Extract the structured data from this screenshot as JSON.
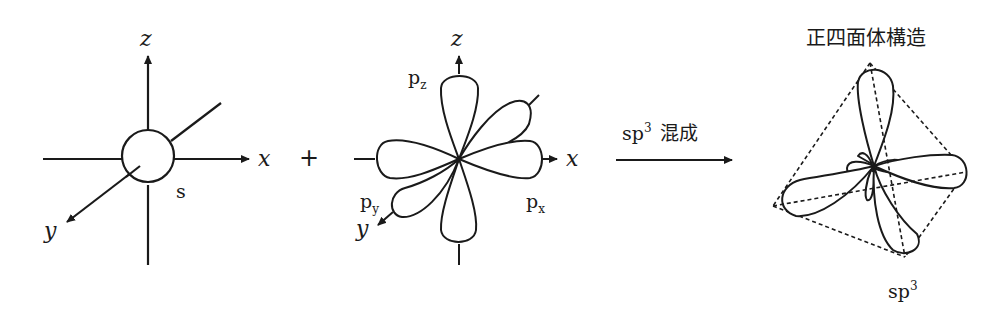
{
  "diagram": {
    "type": "orbital hybridization diagram",
    "colors": {
      "stroke": "#1a1a1a",
      "background": "#ffffff"
    },
    "s_orbital_panel": {
      "axis_labels": {
        "z": "z",
        "x": "x",
        "y": "y"
      },
      "orbital_label": "s"
    },
    "operator": "+",
    "p_orbital_panel": {
      "axis_labels": {
        "z": "z",
        "x": "x",
        "y": "y"
      },
      "orbital_labels": {
        "pz": {
          "base": "p",
          "sub": "z"
        },
        "py": {
          "base": "p",
          "sub": "y"
        },
        "px": {
          "base": "p",
          "sub": "x"
        }
      }
    },
    "reaction_arrow": {
      "label_base": "sp",
      "label_sup": "3",
      "label_text": "混成"
    },
    "hybrid_panel": {
      "title": "正四面体構造",
      "orbital_label_base": "sp",
      "orbital_label_sup": "3"
    }
  }
}
